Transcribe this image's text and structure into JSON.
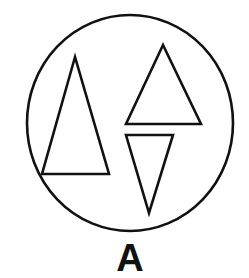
{
  "figure": {
    "label": "A",
    "stroke_color": "#111111",
    "background": "#ffffff",
    "circle": {
      "cx": 130,
      "cy": 123,
      "rx": 103,
      "ry": 108
    },
    "shapes": [
      {
        "name": "tall-triangle",
        "orientation": "up",
        "points": "75,57 42,174 109,174"
      },
      {
        "name": "upper-triangle",
        "orientation": "up",
        "points": "163,45 126,124 201,124"
      },
      {
        "name": "inverted-triangle",
        "orientation": "down",
        "points": "126,135 173,135 149,213"
      }
    ]
  }
}
